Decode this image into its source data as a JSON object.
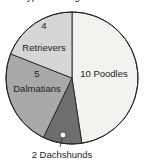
{
  "chart_data": {
    "type": "pie",
    "title": "Types of Dogs at Show",
    "total": 21,
    "slices": [
      {
        "label": "Poodles",
        "value": 10,
        "display": "10 Poodles",
        "color": "#f2f2ef"
      },
      {
        "label": "Dachshunds",
        "value": 2,
        "display": "2 Dachshunds",
        "color": "#6e6e6e"
      },
      {
        "label": "Dalmatians",
        "value": 5,
        "display_line1": "5",
        "display_line2": "Dalmatians",
        "color": "#a9a9a9"
      },
      {
        "label": "Retrievers",
        "value": 4,
        "display_line1": "4",
        "display_line2": "Retrievers",
        "color": "#d6d6d6"
      }
    ],
    "legend": "none (labels on slices)"
  }
}
